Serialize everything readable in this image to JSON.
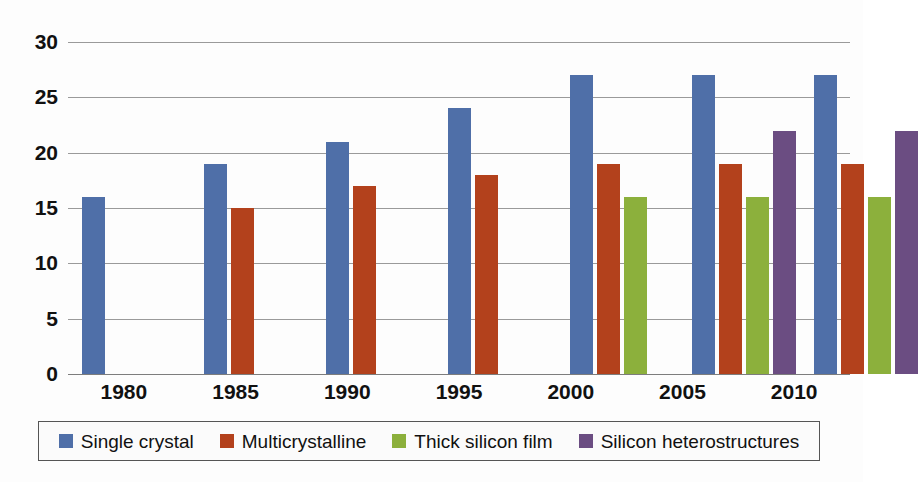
{
  "chart_data": {
    "type": "bar",
    "title": "",
    "subtitle": "",
    "xlabel": "",
    "ylabel": "",
    "categories": [
      "1980",
      "1985",
      "1990",
      "1995",
      "2000",
      "2005",
      "2010"
    ],
    "ylim": [
      0,
      30
    ],
    "yticks": [
      0,
      5,
      10,
      15,
      20,
      25,
      30
    ],
    "ytick_labels": [
      "0",
      "5",
      "10",
      "15",
      "20",
      "25",
      "30"
    ],
    "grid": true,
    "legend_position": "bottom",
    "series": [
      {
        "name": "Single crystal",
        "color": "#4F6FA8",
        "values": [
          16,
          19,
          21,
          24,
          27,
          27,
          27
        ]
      },
      {
        "name": "Multicrystalline",
        "color": "#B3411C",
        "values": [
          null,
          15,
          17,
          18,
          19,
          19,
          19
        ]
      },
      {
        "name": "Thick silicon film",
        "color": "#8CB03C",
        "values": [
          null,
          null,
          null,
          null,
          16,
          16,
          16
        ]
      },
      {
        "name": "Silicon heterostructures",
        "color": "#6B4D82",
        "values": [
          null,
          null,
          null,
          null,
          null,
          22,
          22
        ]
      }
    ]
  },
  "axis": {
    "y_tick_labels": [
      "30",
      "25",
      "20",
      "15",
      "10",
      "5",
      "0"
    ],
    "x_tick_labels": [
      "1980",
      "1985",
      "1990",
      "1995",
      "2000",
      "2005",
      "2010"
    ]
  },
  "legend": {
    "items": [
      {
        "label": "Single crystal",
        "color": "#4F6FA8"
      },
      {
        "label": "Multicrystalline",
        "color": "#B3411C"
      },
      {
        "label": "Thick silicon film",
        "color": "#8CB03C"
      },
      {
        "label": "Silicon heterostructures",
        "color": "#6B4D82"
      }
    ]
  },
  "colors": {
    "single_crystal": "#4F6FA8",
    "multicrystalline": "#B3411C",
    "thick_silicon_film": "#8CB03C",
    "silicon_heterostructures": "#6B4D82",
    "gridline": "#9a9a9a",
    "text": "#111111",
    "background": "#fdfdfd"
  }
}
